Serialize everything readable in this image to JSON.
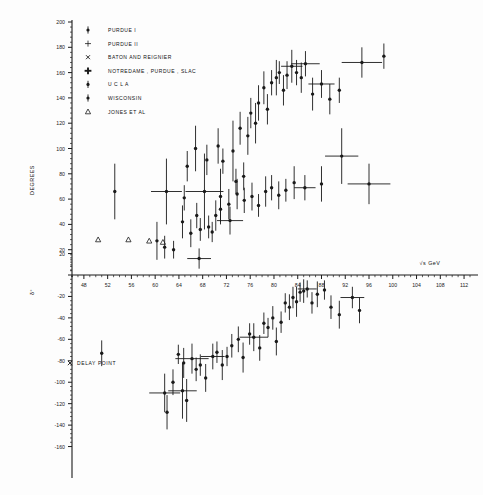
{
  "figure": {
    "background_color": "#fdfdfd",
    "ink_color": "#1a1a1a",
    "xlabel": "√s  GeV",
    "ylabel_upper": "DEGREES",
    "ylabel_lower": "δ°",
    "delay_point_label": "×  DELAY POINT"
  },
  "legend": {
    "items": [
      {
        "label": "PURDUE  I",
        "marker": "dot-errorbar-icon"
      },
      {
        "label": "PURDUE  ІІ",
        "marker": "small-cross-icon"
      },
      {
        "label": "BATON AND REIGNIER",
        "marker": "x-cross-icon"
      },
      {
        "label": "NOTREDAME , PURDUE , SLAC",
        "marker": "bold-cross-icon"
      },
      {
        "label": "U C L A",
        "marker": "dot-errorbar-icon"
      },
      {
        "label": "WISCONSIN",
        "marker": "dot-errorbar-icon"
      },
      {
        "label": "JONES ET AL",
        "marker": "triangle-icon"
      }
    ]
  },
  "chart_data": {
    "type": "scatter",
    "title": "",
    "xlabel": "√s  GeV",
    "ylabel": "DEGREES",
    "grid": false,
    "legend_position": "top-left",
    "panels": [
      {
        "name": "upper-panel",
        "ylabel": "DEGREES",
        "xlim": [
          46,
          113
        ],
        "ylim": [
          0,
          200
        ],
        "xticks": [
          48,
          52,
          56,
          60,
          64,
          68,
          72,
          76,
          80,
          84,
          88,
          92,
          96,
          100,
          104,
          108,
          112
        ],
        "yticks": [
          0,
          20,
          40,
          60,
          80,
          100,
          120,
          140,
          160,
          180,
          200
        ],
        "ytick_labels": [
          "0",
          "20",
          "40",
          "60",
          "80",
          "100",
          "120",
          "140",
          "160",
          "180",
          "200"
        ],
        "series": [
          {
            "name": "JONES ET AL",
            "marker": "triangle",
            "points": [
              {
                "x": 50.4,
                "y": 28
              },
              {
                "x": 55.5,
                "y": 28
              },
              {
                "x": 59.0,
                "y": 27
              },
              {
                "x": 61.3,
                "y": 26
              }
            ]
          },
          {
            "name": "main-branch-upper",
            "marker": "dot-errorbar",
            "points": [
              {
                "x": 53.2,
                "y": 66,
                "ey": 22
              },
              {
                "x": 60.3,
                "y": 27,
                "ey": 15
              },
              {
                "x": 61.6,
                "y": 22,
                "ey": 9
              },
              {
                "x": 61.9,
                "y": 66,
                "ey": 26,
                "ex": 2.6
              },
              {
                "x": 63.1,
                "y": 20,
                "ey": 7
              },
              {
                "x": 64.6,
                "y": 42,
                "ey": 13
              },
              {
                "x": 64.9,
                "y": 61,
                "ey": 10
              },
              {
                "x": 65.4,
                "y": 86,
                "ey": 12
              },
              {
                "x": 66.0,
                "y": 33,
                "ey": 11
              },
              {
                "x": 66.8,
                "y": 100,
                "ey": 18
              },
              {
                "x": 67.0,
                "y": 47,
                "ey": 10
              },
              {
                "x": 67.6,
                "y": 36,
                "ey": 9
              },
              {
                "x": 68.3,
                "y": 66,
                "ey": 30,
                "ex": 3.2
              },
              {
                "x": 68.7,
                "y": 91,
                "ey": 12
              },
              {
                "x": 69.0,
                "y": 38,
                "ey": 9
              },
              {
                "x": 69.6,
                "y": 34,
                "ey": 8
              },
              {
                "x": 70.6,
                "y": 102,
                "ey": 14
              },
              {
                "x": 71.0,
                "y": 62,
                "ey": 22
              },
              {
                "x": 71.4,
                "y": 90,
                "ey": 10
              },
              {
                "x": 72.4,
                "y": 56,
                "ey": 12
              },
              {
                "x": 73.1,
                "y": 98,
                "ey": 24
              },
              {
                "x": 73.6,
                "y": 74,
                "ey": 10
              },
              {
                "x": 74.3,
                "y": 116,
                "ey": 13
              },
              {
                "x": 74.9,
                "y": 78,
                "ey": 11
              },
              {
                "x": 75.6,
                "y": 110,
                "ey": 15
              },
              {
                "x": 76.1,
                "y": 128,
                "ey": 12
              },
              {
                "x": 76.9,
                "y": 120,
                "ey": 16
              },
              {
                "x": 77.4,
                "y": 136,
                "ey": 14
              },
              {
                "x": 78.3,
                "y": 148,
                "ey": 13
              },
              {
                "x": 78.9,
                "y": 131,
                "ey": 12
              },
              {
                "x": 79.6,
                "y": 152,
                "ey": 10
              },
              {
                "x": 80.4,
                "y": 156,
                "ey": 14
              },
              {
                "x": 80.9,
                "y": 160,
                "ey": 9
              },
              {
                "x": 81.6,
                "y": 146,
                "ey": 12
              },
              {
                "x": 82.2,
                "y": 158,
                "ey": 11
              },
              {
                "x": 83.0,
                "y": 165,
                "ey": 13,
                "ex": 1.8
              },
              {
                "x": 83.8,
                "y": 160,
                "ey": 10
              },
              {
                "x": 84.6,
                "y": 156,
                "ey": 12
              },
              {
                "x": 85.3,
                "y": 167,
                "ey": 10,
                "ex": 2.4
              },
              {
                "x": 86.5,
                "y": 143,
                "ey": 13
              },
              {
                "x": 88.0,
                "y": 151,
                "ey": 11,
                "ex": 2.2
              },
              {
                "x": 89.4,
                "y": 139,
                "ey": 12
              },
              {
                "x": 91.0,
                "y": 146,
                "ey": 10
              },
              {
                "x": 94.8,
                "y": 168,
                "ey": 12,
                "ex": 3.4
              },
              {
                "x": 98.5,
                "y": 173,
                "ey": 10
              }
            ]
          },
          {
            "name": "lower-branch-upper",
            "marker": "dot-errorbar",
            "points": [
              {
                "x": 67.4,
                "y": 13,
                "ey": 8,
                "ex": 2.0
              },
              {
                "x": 70.2,
                "y": 47,
                "ey": 12
              },
              {
                "x": 71.0,
                "y": 52,
                "ey": 10
              },
              {
                "x": 72.6,
                "y": 43,
                "ey": 11,
                "ex": 2.2
              },
              {
                "x": 73.8,
                "y": 64,
                "ey": 12
              },
              {
                "x": 75.0,
                "y": 59,
                "ey": 10
              },
              {
                "x": 76.3,
                "y": 62,
                "ey": 11
              },
              {
                "x": 77.4,
                "y": 55,
                "ey": 9
              },
              {
                "x": 78.6,
                "y": 66,
                "ey": 12
              },
              {
                "x": 79.6,
                "y": 69,
                "ey": 10
              },
              {
                "x": 80.8,
                "y": 63,
                "ey": 11
              },
              {
                "x": 82.0,
                "y": 67,
                "ey": 9
              },
              {
                "x": 83.4,
                "y": 73,
                "ey": 13
              },
              {
                "x": 85.2,
                "y": 69,
                "ey": 10,
                "ex": 1.8
              },
              {
                "x": 88.0,
                "y": 72,
                "ey": 14
              },
              {
                "x": 91.4,
                "y": 94,
                "ey": 22,
                "ex": 2.8
              },
              {
                "x": 96.0,
                "y": 72,
                "ey": 16,
                "ex": 3.6
              }
            ]
          }
        ]
      },
      {
        "name": "lower-panel",
        "ylabel": "δ°",
        "xlim": [
          46,
          113
        ],
        "ylim": [
          -160,
          30
        ],
        "yticks": [
          20,
          -20,
          -40,
          -60,
          -80,
          -100,
          -120,
          -140,
          -160
        ],
        "ytick_labels": [
          "20",
          "-20",
          "-40",
          "-60",
          "-80",
          "-100",
          "-120",
          "-140",
          "-160"
        ],
        "series": [
          {
            "name": "delay-point",
            "marker": "dot-errorbar",
            "points": [
              {
                "x": 51.0,
                "y": -73,
                "ey": 12
              }
            ]
          },
          {
            "name": "main-branch-lower",
            "marker": "dot-errorbar",
            "points": [
              {
                "x": 61.6,
                "y": -110,
                "ey": 18,
                "ex": 2.6
              },
              {
                "x": 62.0,
                "y": -128,
                "ey": 16
              },
              {
                "x": 63.0,
                "y": -100,
                "ey": 12
              },
              {
                "x": 63.9,
                "y": -74,
                "ey": 9
              },
              {
                "x": 64.6,
                "y": -108,
                "ey": 26,
                "ex": 2.4
              },
              {
                "x": 64.8,
                "y": -82,
                "ey": 14
              },
              {
                "x": 65.3,
                "y": -117,
                "ey": 20
              },
              {
                "x": 66.2,
                "y": -78,
                "ey": 14,
                "ex": 2.8
              },
              {
                "x": 66.9,
                "y": -88,
                "ey": 11
              },
              {
                "x": 67.6,
                "y": -84,
                "ey": 10
              },
              {
                "x": 68.5,
                "y": -96,
                "ey": 13
              },
              {
                "x": 69.7,
                "y": -76,
                "ey": 12,
                "ex": 2.0
              },
              {
                "x": 70.4,
                "y": -72,
                "ey": 10
              },
              {
                "x": 71.3,
                "y": -84,
                "ey": 14
              },
              {
                "x": 72.1,
                "y": -76,
                "ey": 9
              },
              {
                "x": 72.9,
                "y": -66,
                "ey": 11
              },
              {
                "x": 74.0,
                "y": -60,
                "ey": 12
              },
              {
                "x": 74.8,
                "y": -77,
                "ey": 14
              },
              {
                "x": 75.9,
                "y": -55,
                "ey": 10
              },
              {
                "x": 76.6,
                "y": -58,
                "ey": 13,
                "ex": 2.4
              },
              {
                "x": 77.6,
                "y": -68,
                "ey": 12
              },
              {
                "x": 78.3,
                "y": -45,
                "ey": 10
              },
              {
                "x": 79.0,
                "y": -49,
                "ey": 9
              },
              {
                "x": 79.8,
                "y": -40,
                "ey": 11
              },
              {
                "x": 80.4,
                "y": -62,
                "ey": 13
              },
              {
                "x": 81.2,
                "y": -44,
                "ey": 10
              },
              {
                "x": 81.9,
                "y": -26,
                "ey": 9
              },
              {
                "x": 82.6,
                "y": -30,
                "ey": 12
              },
              {
                "x": 83.2,
                "y": -21,
                "ey": 10
              },
              {
                "x": 83.8,
                "y": -25,
                "ey": 14
              },
              {
                "x": 84.4,
                "y": -16,
                "ey": 9
              },
              {
                "x": 85.0,
                "y": -15,
                "ey": 11
              },
              {
                "x": 85.6,
                "y": -13,
                "ey": 8,
                "ex": 1.6
              },
              {
                "x": 86.4,
                "y": -26,
                "ey": 10
              },
              {
                "x": 87.3,
                "y": -18,
                "ey": 12
              },
              {
                "x": 88.5,
                "y": -14,
                "ey": 9
              },
              {
                "x": 89.6,
                "y": -30,
                "ey": 11
              },
              {
                "x": 91.0,
                "y": -37,
                "ey": 13
              },
              {
                "x": 93.2,
                "y": -21,
                "ey": 10,
                "ex": 2.0
              },
              {
                "x": 94.4,
                "y": -33,
                "ey": 12
              }
            ]
          }
        ]
      }
    ]
  }
}
